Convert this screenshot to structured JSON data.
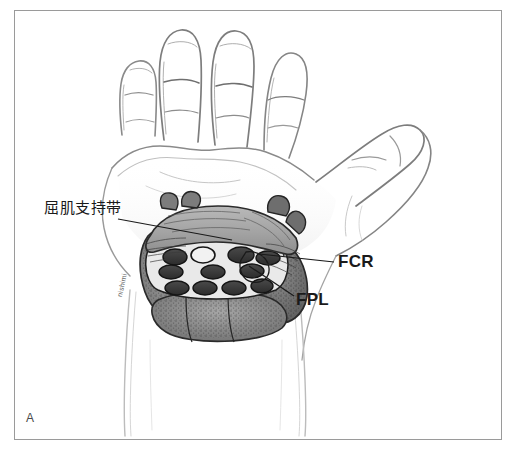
{
  "figure": {
    "panel_letter": "A",
    "artist_signature": "nishimi",
    "background_color": "#ffffff",
    "frame_border_color": "#9a9a9a",
    "medium": "pencil-sketch-with-grayscale-wash"
  },
  "labels": {
    "flexor_retinaculum": "屈肌支持带",
    "fcr": "FCR",
    "fpl": "FPL"
  },
  "annotations": [
    {
      "name": "flexor-retinaculum-leader",
      "label": "屈肌支持带",
      "from": [
        118,
        219
      ],
      "to": [
        232,
        240
      ]
    },
    {
      "name": "fcr-leader",
      "label": "FCR",
      "from": [
        334,
        262
      ],
      "to": [
        259,
        254
      ]
    },
    {
      "name": "fpl-leader",
      "label": "FPL",
      "from": [
        294,
        296
      ],
      "to": [
        249,
        266
      ]
    }
  ],
  "anatomy": {
    "view": "palmar view of right hand with carpal tunnel cross-section",
    "structures": [
      "hand outline",
      "index finger",
      "middle finger",
      "ring finger",
      "little finger",
      "thumb",
      "palm",
      "wrist",
      "forearm",
      "flexor retinaculum",
      "thenar muscles",
      "hypothenar muscles",
      "flexor digitorum tendons",
      "median nerve",
      "flexor carpi radialis tendon",
      "flexor pollicis longus tendon"
    ]
  },
  "palette": {
    "ink": "#1a1a1a",
    "sketch_line": "#8d8d8d",
    "sketch_line_light": "#b8b8b8",
    "tissue_mid": "#9b9b9b",
    "tissue_light": "#c2c2c2",
    "tissue_dark": "#6a6a6a",
    "tendon_fill": "#3c3c3c",
    "retinaculum_fill": "#a8a8a8",
    "muscle_fill": "#8a8a8a"
  }
}
